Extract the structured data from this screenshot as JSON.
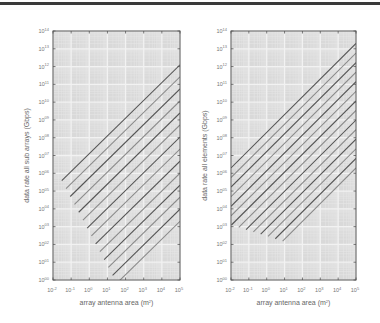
{
  "chart_data": [
    {
      "type": "line",
      "panel": "left",
      "title": "",
      "xlabel": "array antenna area (m²)",
      "ylabel": "data rate all sub arrays (Gbps)",
      "xscale": "log",
      "yscale": "log",
      "xlim": [
        0.01,
        100000
      ],
      "ylim": [
        1,
        100000000000000
      ],
      "x_ticks": [
        "10^-2",
        "10^-1",
        "10^0",
        "10^1",
        "10^2",
        "10^3",
        "10^4",
        "10^5"
      ],
      "y_ticks": [
        "10^00",
        "10^01",
        "10^02",
        "10^03",
        "10^04",
        "10^05",
        "10^06",
        "10^07",
        "10^08",
        "10^09",
        "10^10",
        "10^11",
        "10^12",
        "10^13",
        "10^14"
      ],
      "grid": true,
      "legend": "none",
      "series_count": 14,
      "series_description": "Family of parallel straight lines (slope ~1 in log-log) forming a dense hatched band",
      "band": {
        "top_line_at_xmax_log10y": 12.1,
        "bottom_line_at_xmax_log10y": 3.3,
        "left_edge_log10y": 6.5,
        "lowest_point_log10x": 1.0,
        "lowest_point_log10y": 0.8
      }
    },
    {
      "type": "line",
      "panel": "right",
      "title": "",
      "xlabel": "array antenna area (m²)",
      "ylabel": "data rate all elements (Gbps)",
      "xscale": "log",
      "yscale": "log",
      "xlim": [
        0.01,
        100000
      ],
      "ylim": [
        1,
        100000000000000
      ],
      "x_ticks": [
        "10^-2",
        "10^-1",
        "10^0",
        "10^1",
        "10^2",
        "10^3",
        "10^4",
        "10^5"
      ],
      "y_ticks": [
        "10^00",
        "10^01",
        "10^02",
        "10^03",
        "10^04",
        "10^05",
        "10^06",
        "10^07",
        "10^08",
        "10^09",
        "10^10",
        "10^11",
        "10^12",
        "10^13",
        "10^14"
      ],
      "grid": true,
      "legend": "none",
      "series_count": 14,
      "series_description": "Family of parallel straight lines (slope ~1 in log-log) forming a dense hatched band",
      "band": {
        "top_line_at_xmax_log10y": 13.3,
        "bottom_line_at_xmax_log10y": 6.3,
        "left_edge_log10y": 3.1,
        "lowest_point_log10x": 1.5,
        "lowest_point_log10y": 2.0
      }
    }
  ],
  "panels": {
    "left": {
      "ylabel": "data rate all sub arrays (Gbps)",
      "xlabel": "array antenna area (m",
      "xlabel_sup": "2",
      "xlabel_end": ")"
    },
    "right": {
      "ylabel": "data rate all elements (Gbps)",
      "xlabel": "array antenna area (m",
      "xlabel_sup": "2",
      "xlabel_end": ")"
    },
    "x_ticks": [
      {
        "base": "10",
        "exp": "-2"
      },
      {
        "base": "10",
        "exp": "-1"
      },
      {
        "base": "10",
        "exp": "0"
      },
      {
        "base": "10",
        "exp": "1"
      },
      {
        "base": "10",
        "exp": "2"
      },
      {
        "base": "10",
        "exp": "3"
      },
      {
        "base": "10",
        "exp": "4"
      },
      {
        "base": "10",
        "exp": "5"
      }
    ],
    "y_ticks": [
      {
        "base": "10",
        "exp": "00"
      },
      {
        "base": "10",
        "exp": "01"
      },
      {
        "base": "10",
        "exp": "02"
      },
      {
        "base": "10",
        "exp": "03"
      },
      {
        "base": "10",
        "exp": "04"
      },
      {
        "base": "10",
        "exp": "05"
      },
      {
        "base": "10",
        "exp": "06"
      },
      {
        "base": "10",
        "exp": "07"
      },
      {
        "base": "10",
        "exp": "08"
      },
      {
        "base": "10",
        "exp": "09"
      },
      {
        "base": "10",
        "exp": "10"
      },
      {
        "base": "10",
        "exp": "11"
      },
      {
        "base": "10",
        "exp": "12"
      },
      {
        "base": "10",
        "exp": "13"
      },
      {
        "base": "10",
        "exp": "14"
      }
    ]
  },
  "colors": {
    "plot_background": "#d9d9d9",
    "grid_major": "#f2f2f2",
    "grid_minor": "#e6e6e6",
    "frame": "#555555",
    "line_dark": "#555555",
    "line_light": "#8a8a8a",
    "top_rule": "#3a3a3a"
  }
}
